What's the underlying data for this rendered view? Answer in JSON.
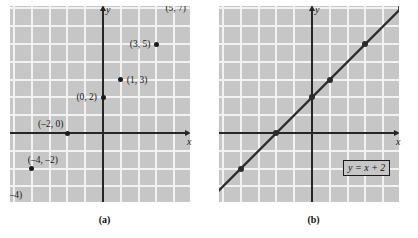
{
  "figure": {
    "background": "#ffffff",
    "grid_color": "#c6c6c6",
    "gridline_color": "#f2f2f2",
    "axis_color": "#262626",
    "point_color": "#1a1a1a"
  },
  "panel_a": {
    "caption": "(a)",
    "x_axis_label": "x",
    "y_axis_label": "y",
    "points": [
      {
        "label": "(–6, –4)",
        "x": -6,
        "y": -4
      },
      {
        "label": "(–4, –2)",
        "x": -4,
        "y": -2
      },
      {
        "label": "(–2, 0)",
        "x": -2,
        "y": 0
      },
      {
        "label": "(0, 2)",
        "x": 0,
        "y": 2
      },
      {
        "label": "(1, 3)",
        "x": 1,
        "y": 3
      },
      {
        "label": "(3, 5)",
        "x": 3,
        "y": 5
      },
      {
        "label": "(5, 7)",
        "x": 5,
        "y": 7
      }
    ]
  },
  "panel_b": {
    "caption": "(b)",
    "x_axis_label": "x",
    "y_axis_label": "y",
    "equation_label": "y = x + 2",
    "points": [
      {
        "x": -6,
        "y": -4
      },
      {
        "x": -4,
        "y": -2
      },
      {
        "x": -2,
        "y": 0
      },
      {
        "x": 0,
        "y": 2
      },
      {
        "x": 1,
        "y": 3
      },
      {
        "x": 3,
        "y": 5
      },
      {
        "x": 5,
        "y": 7
      }
    ]
  },
  "chart_data": {
    "type": "scatter",
    "title": "",
    "xlabel": "x",
    "ylabel": "y",
    "grid": true,
    "legend": "none",
    "panels": [
      {
        "name": "(a)",
        "type": "scatter",
        "x": [
          -6,
          -4,
          -2,
          0,
          1,
          3,
          5
        ],
        "y": [
          -4,
          -2,
          0,
          2,
          3,
          5,
          7
        ],
        "point_labels": [
          "(–6, –4)",
          "(–4, –2)",
          "(–2, 0)",
          "(0, 2)",
          "(1, 3)",
          "(3, 5)",
          "(5, 7)"
        ],
        "xlim": [
          -7.2,
          4.8
        ],
        "ylim": [
          -5.5,
          7.9
        ],
        "xlabel": "x",
        "ylabel": "y"
      },
      {
        "name": "(b)",
        "type": "line",
        "equation": "y = x + 2",
        "x": [
          -6,
          -4,
          -2,
          0,
          1,
          3,
          5
        ],
        "y": [
          -4,
          -2,
          0,
          2,
          3,
          5,
          7
        ],
        "slope": 1,
        "intercept": 2,
        "xlim": [
          -7.2,
          4.8
        ],
        "ylim": [
          -5.5,
          7.9
        ],
        "xlabel": "x",
        "ylabel": "y"
      }
    ]
  }
}
